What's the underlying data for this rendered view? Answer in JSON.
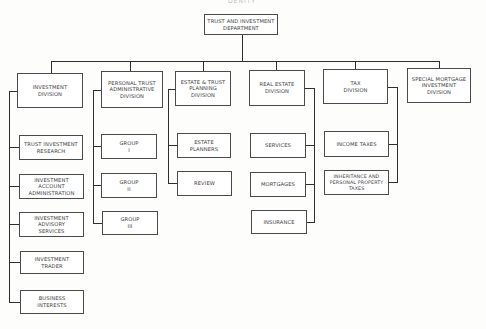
{
  "title_fragment": "DENITY",
  "root": {
    "label": "TRUST AND INVESTMENT\nDEPARTMENT"
  },
  "divisions": [
    {
      "label": "INVESTMENT\nDIVISION",
      "children": [
        "TRUST INVESTMENT\nRESEARCH",
        "INVESTMENT\nACCOUNT\nADMINISTRATION",
        "INVESTMENT\nADVISORY\nSERVICES",
        "INVESTMENT\nTRADER",
        "BUSINESS\nINTERESTS"
      ]
    },
    {
      "label": "PERSONAL TRUST\nADMINISTRATIVE\nDIVISION",
      "children": [
        "GROUP\nI",
        "GROUP\nII",
        "GROUP\nIII"
      ]
    },
    {
      "label": "ESTATE & TRUST\nPLANNING\nDIVISION",
      "children": [
        "ESTATE PLANNERS",
        "REVIEW"
      ]
    },
    {
      "label": "REAL ESTATE\nDIVISION",
      "children": [
        "SERVICES",
        "MORTGAGES",
        "INSURANCE"
      ]
    },
    {
      "label": "TAX\nDIVISION",
      "children": [
        "INCOME TAXES",
        "INHERITANCE AND\nPERSONAL PROPERTY\nTAXES"
      ]
    },
    {
      "label": "SPECIAL MORTGAGE\nINVESTMENT\nDIVISION",
      "children": []
    }
  ]
}
